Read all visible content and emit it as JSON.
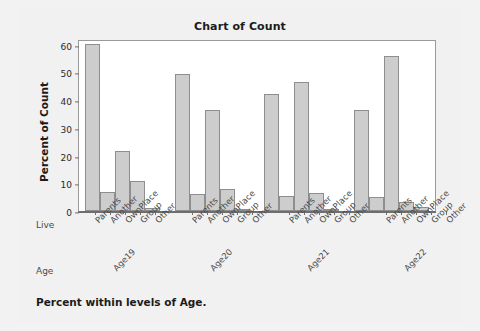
{
  "chart_data": {
    "type": "bar",
    "title": "Chart of Count",
    "xlabel": "",
    "ylabel": "Percent of Count",
    "ylim": [
      0,
      62
    ],
    "yticks": [
      0,
      10,
      20,
      30,
      40,
      50,
      60
    ],
    "grid": false,
    "legend": "none",
    "row_labels": {
      "category": "Live",
      "group": "Age"
    },
    "categories": [
      "Parents",
      "Another",
      "OwnPlace",
      "Group",
      "Other"
    ],
    "groups": [
      "Age19",
      "Age20",
      "Age21",
      "Age22"
    ],
    "series": [
      {
        "name": "Age19",
        "values": [
          60.3,
          6.8,
          21.5,
          10.9,
          1.0
        ]
      },
      {
        "name": "Age20",
        "values": [
          49.4,
          6.3,
          36.4,
          8.0,
          0.4
        ]
      },
      {
        "name": "Age21",
        "values": [
          42.0,
          5.4,
          46.5,
          6.4,
          0.8
        ]
      },
      {
        "name": "Age22",
        "values": [
          36.5,
          4.9,
          56.0,
          3.4,
          1.4
        ]
      }
    ],
    "footnote": "Percent within levels of Age.",
    "colors": {
      "bar_fill": "#cdcdcd",
      "bar_edge": "#8e8e8e",
      "plot_background": "#ffffff",
      "page_background": "#f1f1f1",
      "text": "#1b1b1b",
      "axis": "#6e6e6e"
    }
  }
}
